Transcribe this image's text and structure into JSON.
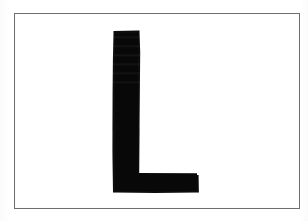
{
  "image": {
    "kind": "scanned-character-sample",
    "width": 308,
    "height": 221,
    "background_color": "#ffffff",
    "alt_text": "Scanned image of the capital letter L inside a thin rectangular border"
  },
  "frame": {
    "name": "border-rectangle",
    "border_color": "#6e6e70",
    "border_width_px": 1,
    "left": 14,
    "top": 13,
    "width": 286,
    "height": 196,
    "fill_color": "#ffffff"
  },
  "glyph": {
    "character": "L",
    "label": "capital letter L",
    "ink_color": "#0d0d0d",
    "stem": {
      "name": "vertical-stem",
      "left": 112,
      "top": 30,
      "width": 28,
      "height": 163
    },
    "arm": {
      "name": "bottom-arm",
      "left": 112,
      "top": 175,
      "width": 87,
      "height": 18
    },
    "bounding_box": {
      "left": 112,
      "top": 30,
      "right": 199,
      "bottom": 193,
      "width": 87,
      "height": 163
    }
  },
  "artifacts": {
    "scan_banding": "faint horizontal lighter bands across upper stem",
    "edge_softness": "anti-aliased gray fringe around ink edges"
  }
}
